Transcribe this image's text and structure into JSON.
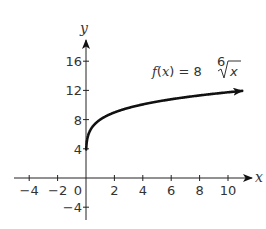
{
  "chart_data": {
    "type": "line",
    "title": "",
    "function_label": "f(x) = 8⁶√x",
    "function_label_parts": {
      "lhs": "f(x)",
      "eq": "=",
      "coef": "8",
      "index": "6",
      "radicand": "x"
    },
    "xlabel": "x",
    "ylabel": "y",
    "xlim": [
      -5,
      11.5
    ],
    "ylim": [
      -5.5,
      18.5
    ],
    "x_ticks": [
      -4,
      -2,
      2,
      4,
      6,
      8,
      10
    ],
    "y_ticks": [
      -4,
      4,
      8,
      12,
      16
    ],
    "origin_label": "0",
    "grid": false,
    "series": [
      {
        "name": "f(x) = 8 * x^(1/6)",
        "x": [
          0,
          0.01,
          0.1,
          0.5,
          1,
          2,
          4,
          6,
          8,
          10,
          11
        ],
        "y": [
          0,
          3.71,
          5.45,
          7.13,
          8,
          8.98,
          10.08,
          10.79,
          11.31,
          11.74,
          11.93
        ],
        "end_arrow": true
      }
    ]
  }
}
